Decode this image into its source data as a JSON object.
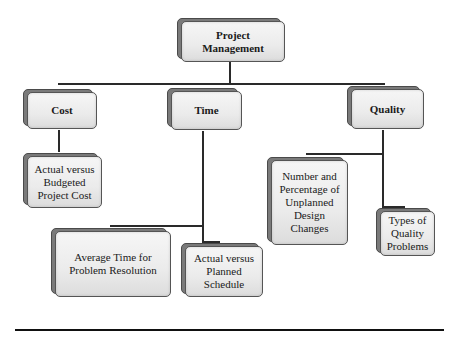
{
  "diagram": {
    "type": "tree",
    "root": {
      "id": "project-management",
      "label": "Project\nManagement"
    },
    "categories": [
      {
        "id": "cost",
        "label": "Cost",
        "children": [
          {
            "id": "actual-vs-budgeted",
            "label": "Actual versus\nBudgeted\nProject Cost"
          }
        ]
      },
      {
        "id": "time",
        "label": "Time",
        "children": [
          {
            "id": "average-time",
            "label": "Average Time for\nProblem Resolution"
          },
          {
            "id": "actual-vs-planned",
            "label": "Actual versus\nPlanned\nSchedule"
          }
        ]
      },
      {
        "id": "quality",
        "label": "Quality",
        "children": [
          {
            "id": "unplanned-changes",
            "label": "Number and\nPercentage of\nUnplanned\nDesign\nChanges"
          },
          {
            "id": "quality-problems",
            "label": "Types of\nQuality\nProblems"
          }
        ]
      }
    ]
  },
  "colors": {
    "box_face": "#ebebeb",
    "box_back": "#7a7a7a",
    "connector": "#2a2a2a",
    "rule": "#111111"
  }
}
